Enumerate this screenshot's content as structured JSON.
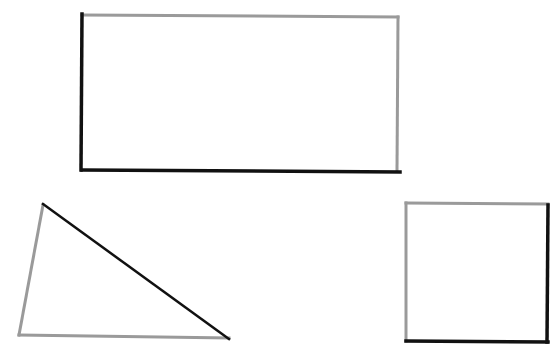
{
  "canvas": {
    "width": 555,
    "height": 351,
    "background": "#ffffff"
  },
  "colors": {
    "dark": "#111111",
    "light": "#9a9a9a"
  },
  "shapes": [
    {
      "name": "rectangle",
      "edges": [
        {
          "side": "top",
          "x1": 82,
          "y1": 15,
          "x2": 398,
          "y2": 17,
          "color": "light",
          "width": 3
        },
        {
          "side": "right",
          "x1": 398,
          "y1": 17,
          "x2": 397,
          "y2": 171,
          "color": "light",
          "width": 3
        },
        {
          "side": "bottom",
          "x1": 82,
          "y1": 170,
          "x2": 400,
          "y2": 172,
          "color": "dark",
          "width": 3.5
        },
        {
          "side": "left",
          "x1": 82,
          "y1": 14,
          "x2": 81,
          "y2": 170,
          "color": "dark",
          "width": 3.5
        }
      ]
    },
    {
      "name": "triangle",
      "edges": [
        {
          "side": "left",
          "x1": 43,
          "y1": 205,
          "x2": 19,
          "y2": 335,
          "color": "light",
          "width": 3
        },
        {
          "side": "bottom",
          "x1": 19,
          "y1": 335,
          "x2": 229,
          "y2": 338,
          "color": "light",
          "width": 3
        },
        {
          "side": "hypotenuse",
          "x1": 43,
          "y1": 204,
          "x2": 229,
          "y2": 339,
          "color": "dark",
          "width": 2.5
        }
      ]
    },
    {
      "name": "square",
      "edges": [
        {
          "side": "top",
          "x1": 406,
          "y1": 203,
          "x2": 548,
          "y2": 204,
          "color": "light",
          "width": 3
        },
        {
          "side": "left",
          "x1": 406,
          "y1": 203,
          "x2": 406,
          "y2": 341,
          "color": "light",
          "width": 3
        },
        {
          "side": "right",
          "x1": 548,
          "y1": 205,
          "x2": 547,
          "y2": 342,
          "color": "dark",
          "width": 3.5
        },
        {
          "side": "bottom",
          "x1": 406,
          "y1": 341,
          "x2": 548,
          "y2": 342,
          "color": "dark",
          "width": 3.5
        }
      ]
    }
  ]
}
